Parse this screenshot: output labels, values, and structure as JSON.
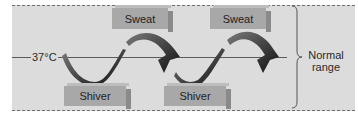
{
  "diagram": {
    "setpoint_label": "37°C",
    "boxes": {
      "sweat_1": "Sweat",
      "sweat_2": "Sweat",
      "shiver_1": "Shiver",
      "shiver_2": "Shiver"
    },
    "range_label_line1": "Normal",
    "range_label_line2": "range",
    "colors": {
      "panel_bg": "#dcdcdc",
      "box_face": "#a8a8a8",
      "ribbon": "#4a4a4a",
      "line": "#5a5a5a"
    }
  }
}
